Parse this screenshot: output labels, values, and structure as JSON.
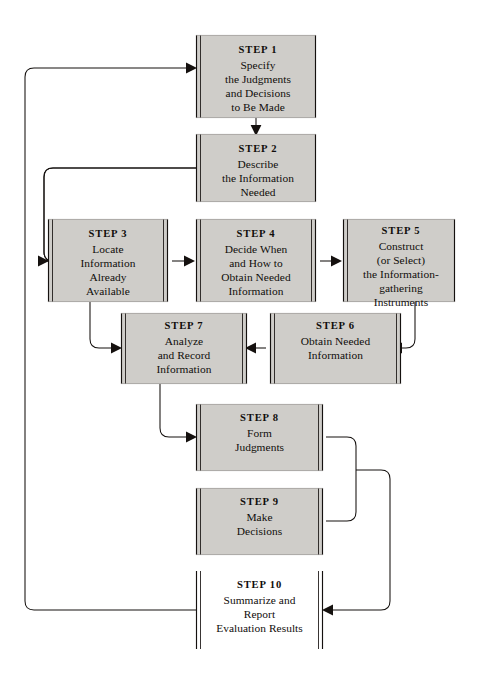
{
  "diagram": {
    "type": "flowchart",
    "background_color": "#ffffff",
    "box_fill_shaded": "#cfcdc9",
    "box_fill_plain": "#ffffff",
    "line_color": "#15110f",
    "nodes": [
      {
        "id": "step1",
        "title": "STEP 1",
        "body": "Specify\nthe Judgments\nand Decisions\nto Be Made",
        "shaded": true,
        "x": 196,
        "y": 35,
        "w": 120,
        "h": 83
      },
      {
        "id": "step2",
        "title": "STEP 2",
        "body": "Describe\nthe Information\nNeeded",
        "shaded": true,
        "x": 196,
        "y": 134,
        "w": 120,
        "h": 68
      },
      {
        "id": "step3",
        "title": "STEP 3",
        "body": "Locate\nInformation\nAlready\nAvailable",
        "shaded": true,
        "x": 48,
        "y": 219,
        "w": 120,
        "h": 83
      },
      {
        "id": "step4",
        "title": "STEP 4",
        "body": "Decide When\nand How to\nObtain Needed\nInformation",
        "shaded": true,
        "x": 196,
        "y": 219,
        "w": 120,
        "h": 83
      },
      {
        "id": "step5",
        "title": "STEP 5",
        "body": "Construct\n(or Select)\nthe Information-\ngathering\nInstruments",
        "shaded": true,
        "x": 343,
        "y": 219,
        "w": 112,
        "h": 83
      },
      {
        "id": "step6",
        "title": "STEP 6",
        "body": "Obtain Needed\nInformation",
        "shaded": true,
        "x": 270,
        "y": 313,
        "w": 131,
        "h": 71
      },
      {
        "id": "step7",
        "title": "STEP 7",
        "body": "Analyze\nand Record\nInformation",
        "shaded": true,
        "x": 121,
        "y": 313,
        "w": 126,
        "h": 71
      },
      {
        "id": "step8",
        "title": "STEP 8",
        "body": "Form\nJudgments",
        "shaded": true,
        "x": 196,
        "y": 404,
        "w": 127,
        "h": 67
      },
      {
        "id": "step9",
        "title": "STEP 9",
        "body": "Make\nDecisions",
        "shaded": true,
        "x": 196,
        "y": 488,
        "w": 127,
        "h": 67
      },
      {
        "id": "step10",
        "title": "STEP 10",
        "body": "Summarize and\nReport\nEvaluation Results",
        "shaded": false,
        "x": 196,
        "y": 571,
        "w": 127,
        "h": 78
      }
    ],
    "connections": [
      {
        "from": "step1",
        "to": "step2",
        "kind": "down"
      },
      {
        "from": "step2",
        "to": "step3",
        "kind": "feedback-left"
      },
      {
        "from": "step3",
        "to": "step4",
        "kind": "right"
      },
      {
        "from": "step4",
        "to": "step5",
        "kind": "right"
      },
      {
        "from": "step5",
        "to": "step6",
        "kind": "down-right-loop"
      },
      {
        "from": "step6",
        "to": "step7",
        "kind": "left"
      },
      {
        "from": "step3",
        "to": "step7",
        "kind": "down-loop"
      },
      {
        "from": "step7",
        "to": "step8",
        "kind": "down-loop"
      },
      {
        "from": "step8",
        "to": "step10",
        "kind": "right-merge"
      },
      {
        "from": "step9",
        "to": "step10",
        "kind": "right-merge"
      },
      {
        "from": "step10",
        "to": "step1",
        "kind": "feedback-far-left"
      }
    ]
  }
}
